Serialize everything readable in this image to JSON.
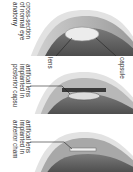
{
  "diagram": {
    "orientation": "rotated-90-clockwise",
    "panels": [
      {
        "id": "normal",
        "caption": "cross-section\nof normal eye\nanatomy",
        "labels": [
          "lens",
          "capsule"
        ]
      },
      {
        "id": "posterior",
        "caption": "artifical lens\nimplanted in\nposterior capsu"
      },
      {
        "id": "anterior",
        "caption": "artifical lens\nimplanted in\nanterior cham"
      }
    ]
  },
  "colors": {
    "background": "#ffffff",
    "outer": "#d8d8d8",
    "cornea": "#bdbdbd",
    "interior": "#6e6e6e",
    "lens": "#e8e8e8",
    "text": "#2a2a2a"
  }
}
